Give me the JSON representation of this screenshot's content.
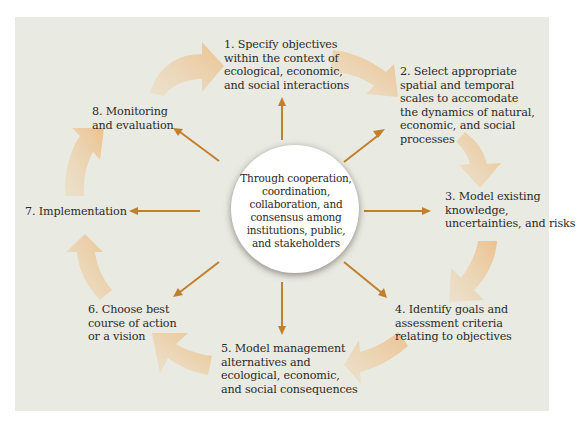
{
  "diagram": {
    "type": "cycle",
    "center": {
      "text": "Through cooperation,\ncoordination,\ncollaboration, and\nconsensus among\ninstitutions, public,\nand stakeholders"
    },
    "steps": [
      {
        "number": 1,
        "text": "1. Specify objectives\nwithin the context of\necological, economic,\nand social interactions"
      },
      {
        "number": 2,
        "text": "2. Select appropriate\nspatial and temporal\nscales to accomodate\nthe dynamics of natural,\neconomic, and social\nprocesses"
      },
      {
        "number": 3,
        "text": "3. Model existing\nknowledge,\nuncertainties, and risks"
      },
      {
        "number": 4,
        "text": "4. Identify goals and\nassessment criteria\nrelating to objectives"
      },
      {
        "number": 5,
        "text": "5. Model management\nalternatives and\necological, economic,\nand social consequences"
      },
      {
        "number": 6,
        "text": "6. Choose best\ncourse of action\nor a vision"
      },
      {
        "number": 7,
        "text": "7. Implementation"
      },
      {
        "number": 8,
        "text": "8. Monitoring\nand evaluation"
      }
    ],
    "flow": "clockwise",
    "colors": {
      "panel_background": "#e9ebe3",
      "cycle_arrow": "#edc99c",
      "spoke_arrow": "#c27f2d",
      "hub_fill": "#ffffff",
      "text": "#2c2a26"
    }
  }
}
